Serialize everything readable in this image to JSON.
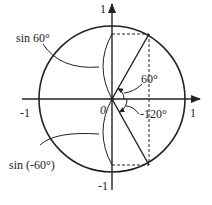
{
  "diagram": {
    "type": "unit-circle",
    "colors": {
      "stroke": "#222222",
      "background": "#ffffff"
    },
    "axes": {
      "x_positive_label": "1",
      "x_negative_label": "-1",
      "y_positive_label": "1",
      "y_negative_label": "-1",
      "origin_label": "0"
    },
    "angles": [
      {
        "label": "60°",
        "degrees": 60
      },
      {
        "label": "-120°",
        "degrees": -120
      }
    ],
    "annotations": [
      {
        "label": "sin 60°"
      },
      {
        "label": "sin (-60°)"
      }
    ]
  }
}
